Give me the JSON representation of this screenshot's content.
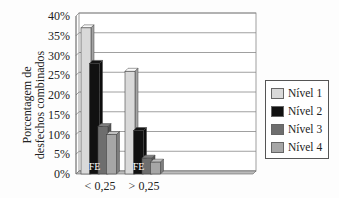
{
  "chart_data": {
    "type": "bar",
    "title": "",
    "xlabel": "",
    "ylabel": "Porcentagem de desfechos combinados",
    "ylabel_lines": [
      "Porcentagem de",
      "desfechos combinados"
    ],
    "categories": [
      "< 0,25",
      "> 0,25"
    ],
    "series": [
      {
        "name": "Nível 1",
        "values": [
          37,
          26
        ],
        "color": "#d9d9d9"
      },
      {
        "name": "Nível 2",
        "values": [
          28,
          11
        ],
        "color": "#111111"
      },
      {
        "name": "Nível 3",
        "values": [
          12,
          4
        ],
        "color": "#6e6e6e"
      },
      {
        "name": "Nível 4",
        "values": [
          10,
          3
        ],
        "color": "#a6a6a6"
      }
    ],
    "ylim": [
      0,
      40
    ],
    "yticks": [
      "0%",
      "5%",
      "10%",
      "15%",
      "20%",
      "25%",
      "30%",
      "35%",
      "40%"
    ],
    "grid": true,
    "legend_position": "right",
    "annotations": [
      {
        "text": "FE",
        "category": "< 0,25"
      },
      {
        "text": "FE",
        "category": "> 0,25"
      }
    ]
  }
}
